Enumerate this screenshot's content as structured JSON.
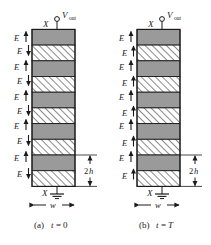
{
  "figure": {
    "background_color": "#ffffff",
    "line_color": "#1a1a1a",
    "layer_fill_gray": "#9a9a9a",
    "layer_fill_hatch_bg": "#ffffff",
    "hatch_line_color": "#2b2b2b",
    "panels": [
      {
        "id": "panel-a",
        "caption": "(a) t=0",
        "caption_prefix": "(a)",
        "caption_variable": "t",
        "caption_equals": "=",
        "caption_value": "0",
        "terminal_top_label": "X",
        "terminal_bottom_label": "X",
        "output_label": "V",
        "output_sublabel": "out",
        "width_label": "w",
        "thickness_label": "2h",
        "thickness_prefix": "2",
        "thickness_variable": "h",
        "field_labels": [
          "E",
          "E",
          "E",
          "E",
          "E",
          "E",
          "E",
          "E",
          "E",
          "E"
        ],
        "field_directions": [
          "up",
          "down",
          "up",
          "down",
          "up",
          "down",
          "up",
          "down",
          "up",
          "down"
        ],
        "layer_types": [
          "gray",
          "hatch",
          "gray",
          "hatch",
          "gray",
          "hatch",
          "gray",
          "hatch",
          "gray",
          "hatch"
        ],
        "layer_count": 10
      },
      {
        "id": "panel-b",
        "caption": "(b) t=T",
        "caption_prefix": "(b)",
        "caption_variable": "t",
        "caption_equals": "=",
        "caption_value": "T",
        "terminal_top_label": "X",
        "terminal_bottom_label": "X",
        "output_label": "V",
        "output_sublabel": "out",
        "width_label": "w",
        "thickness_label": "2h",
        "thickness_prefix": "2",
        "thickness_variable": "h",
        "field_labels": [
          "E",
          "E",
          "E",
          "E",
          "E",
          "E",
          "E",
          "E",
          "E",
          "E"
        ],
        "field_directions": [
          "up",
          "up",
          "up",
          "up",
          "up",
          "up",
          "up",
          "up",
          "up",
          "up"
        ],
        "layer_types": [
          "gray",
          "hatch",
          "gray",
          "hatch",
          "gray",
          "hatch",
          "gray",
          "hatch",
          "gray",
          "hatch"
        ],
        "layer_count": 10
      }
    ]
  }
}
